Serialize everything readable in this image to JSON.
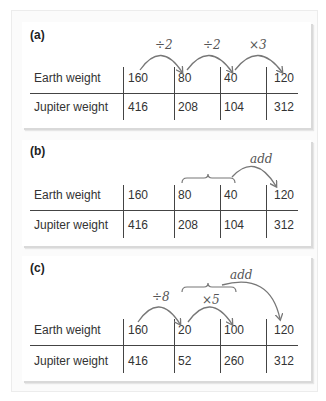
{
  "panels": [
    {
      "label": "(a)",
      "row_labels": [
        "Earth weight",
        "Jupiter weight"
      ],
      "earth": [
        "160",
        "80",
        "40",
        "120"
      ],
      "jupiter": [
        "416",
        "208",
        "104",
        "312"
      ],
      "annotations": [
        "÷2",
        "÷2",
        "×3"
      ]
    },
    {
      "label": "(b)",
      "row_labels": [
        "Earth weight",
        "Jupiter weight"
      ],
      "earth": [
        "160",
        "80",
        "40",
        "120"
      ],
      "jupiter": [
        "416",
        "208",
        "104",
        "312"
      ],
      "annotations": [
        "add"
      ]
    },
    {
      "label": "(c)",
      "row_labels": [
        "Earth weight",
        "Jupiter weight"
      ],
      "earth": [
        "160",
        "20",
        "100",
        "120"
      ],
      "jupiter": [
        "416",
        "52",
        "260",
        "312"
      ],
      "annotations": [
        "÷8",
        "×5",
        "add"
      ]
    }
  ],
  "colors": {
    "arrow": "#777777",
    "rule": "#444444",
    "text": "#333333"
  }
}
